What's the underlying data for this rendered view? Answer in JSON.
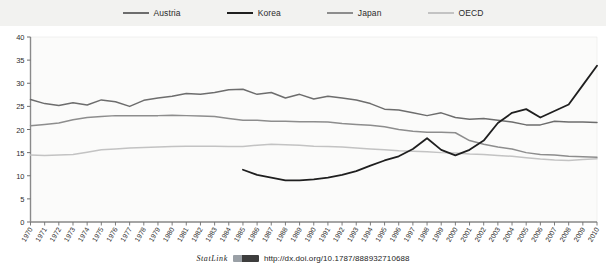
{
  "legend": {
    "position": "top",
    "items": [
      {
        "label": "Austria",
        "color": "#6d6d6d",
        "icon": "line-swatch"
      },
      {
        "label": "Korea",
        "color": "#1f1f1f",
        "icon": "line-swatch"
      },
      {
        "label": "Japan",
        "color": "#8d8d8d",
        "icon": "line-swatch"
      },
      {
        "label": "OECD",
        "color": "#c3c3c3",
        "icon": "line-swatch"
      }
    ]
  },
  "footer": {
    "statlink_word": "StatLink",
    "statlink_url": "http://dx.doi.org/10.1787/888932710688"
  },
  "chart_data": {
    "type": "line",
    "title": "",
    "subtitle": "",
    "xlabel": "",
    "ylabel": "",
    "xlim": [
      1970,
      2010
    ],
    "ylim": [
      0,
      40
    ],
    "yticks": [
      0,
      5,
      10,
      15,
      20,
      25,
      30,
      35,
      40
    ],
    "ytick_labels": [
      "0",
      "5",
      "10",
      "15",
      "20",
      "25",
      "30",
      "35",
      "40"
    ],
    "grid": false,
    "legend_position": "top",
    "x": [
      1970,
      1971,
      1972,
      1973,
      1974,
      1975,
      1976,
      1977,
      1978,
      1979,
      1980,
      1981,
      1982,
      1983,
      1984,
      1985,
      1986,
      1987,
      1988,
      1989,
      1990,
      1991,
      1992,
      1993,
      1994,
      1995,
      1996,
      1997,
      1998,
      1999,
      2000,
      2001,
      2002,
      2003,
      2004,
      2005,
      2006,
      2007,
      2008,
      2009,
      2010
    ],
    "xtick_labels": [
      "1970",
      "1971",
      "1972",
      "1973",
      "1974",
      "1975",
      "1976",
      "1977",
      "1978",
      "1979",
      "1980",
      "1981",
      "1982",
      "1983",
      "1984",
      "1985",
      "1986",
      "1987",
      "1988",
      "1989",
      "1990",
      "1991",
      "1992",
      "1993",
      "1994",
      "1995",
      "1996",
      "1997",
      "1998",
      "1999",
      "2000",
      "2001",
      "2002",
      "2003",
      "2004",
      "2005",
      "2006",
      "2007",
      "2008",
      "2009",
      "2010"
    ],
    "series": [
      {
        "name": "Austria",
        "color": "#6d6d6d",
        "values": [
          26.5,
          25.6,
          25.2,
          25.8,
          25.3,
          26.4,
          26.0,
          25.0,
          26.3,
          26.8,
          27.2,
          27.8,
          27.6,
          28.0,
          28.6,
          28.7,
          27.6,
          28.0,
          26.8,
          27.6,
          26.6,
          27.2,
          26.8,
          26.4,
          25.6,
          24.4,
          24.2,
          23.6,
          23.0,
          23.6,
          22.6,
          22.2,
          22.4,
          22.0,
          21.6,
          21.0,
          21.0,
          21.8,
          21.6,
          21.6,
          21.5
        ]
      },
      {
        "name": "Korea",
        "color": "#1f1f1f",
        "values": [
          null,
          null,
          null,
          null,
          null,
          null,
          null,
          null,
          null,
          null,
          null,
          null,
          null,
          null,
          null,
          11.3,
          10.2,
          9.6,
          9.0,
          9.0,
          9.2,
          9.6,
          10.2,
          11.0,
          12.2,
          13.3,
          14.2,
          15.8,
          18.1,
          15.6,
          14.4,
          15.6,
          17.6,
          21.4,
          23.6,
          24.4,
          22.6,
          24.0,
          25.4,
          29.6,
          33.8
        ]
      },
      {
        "name": "Japan",
        "color": "#8d8d8d",
        "values": [
          20.8,
          21.1,
          21.4,
          22.1,
          22.6,
          22.8,
          23.0,
          23.0,
          23.0,
          23.0,
          23.1,
          23.0,
          22.9,
          22.8,
          22.4,
          22.0,
          22.0,
          21.8,
          21.8,
          21.7,
          21.7,
          21.6,
          21.3,
          21.1,
          20.9,
          20.6,
          20.0,
          19.6,
          19.4,
          19.4,
          19.3,
          17.6,
          16.8,
          16.2,
          15.8,
          15.0,
          14.6,
          14.5,
          14.2,
          14.1,
          14.0
        ]
      },
      {
        "name": "OECD",
        "color": "#c3c3c3",
        "values": [
          14.5,
          14.4,
          14.5,
          14.6,
          15.1,
          15.6,
          15.8,
          16.0,
          16.1,
          16.2,
          16.3,
          16.4,
          16.4,
          16.4,
          16.3,
          16.3,
          16.6,
          16.8,
          16.7,
          16.6,
          16.4,
          16.3,
          16.2,
          16.0,
          15.8,
          15.6,
          15.4,
          15.3,
          15.2,
          15.0,
          14.9,
          14.7,
          14.6,
          14.4,
          14.2,
          13.9,
          13.6,
          13.4,
          13.3,
          13.5,
          13.7
        ]
      }
    ]
  }
}
